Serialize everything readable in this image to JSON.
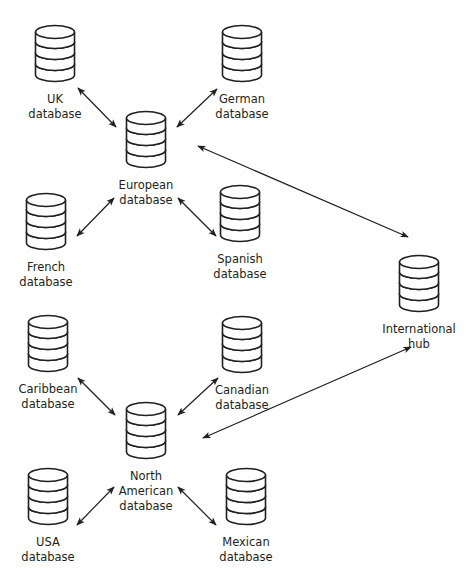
{
  "diagram": {
    "type": "network",
    "colors": {
      "stroke": "#231f20",
      "fill": "#ffffff",
      "background": "#ffffff"
    },
    "nodes": [
      {
        "id": "uk",
        "label": "UK\ndatabase",
        "icon": "database-icon",
        "x": 55,
        "y": 25
      },
      {
        "id": "german",
        "label": "German\ndatabase",
        "icon": "database-icon",
        "x": 242,
        "y": 25
      },
      {
        "id": "european",
        "label": "European\ndatabase",
        "icon": "database-icon",
        "x": 146,
        "y": 111
      },
      {
        "id": "french",
        "label": "French\ndatabase",
        "icon": "database-icon",
        "x": 46,
        "y": 193
      },
      {
        "id": "spanish",
        "label": "Spanish\ndatabase",
        "icon": "database-icon",
        "x": 240,
        "y": 185
      },
      {
        "id": "international",
        "label": "International\nhub",
        "icon": "database-icon",
        "x": 419,
        "y": 255
      },
      {
        "id": "caribbean",
        "label": "Caribbean\ndatabase",
        "icon": "database-icon",
        "x": 48,
        "y": 315
      },
      {
        "id": "canadian",
        "label": "Canadian\ndatabase",
        "icon": "database-icon",
        "x": 242,
        "y": 316
      },
      {
        "id": "north_american",
        "label": "North\nAmerican\ndatabase",
        "icon": "database-icon",
        "x": 146,
        "y": 402
      },
      {
        "id": "usa",
        "label": "USA\ndatabase",
        "icon": "database-icon",
        "x": 48,
        "y": 468
      },
      {
        "id": "mexican",
        "label": "Mexican\ndatabase",
        "icon": "database-icon",
        "x": 246,
        "y": 468
      }
    ],
    "edges": [
      {
        "from": "uk",
        "to": "european",
        "direction": "both",
        "x1": 78,
        "y1": 88,
        "x2": 116,
        "y2": 127
      },
      {
        "from": "german",
        "to": "european",
        "direction": "both",
        "x1": 217,
        "y1": 89,
        "x2": 177,
        "y2": 127
      },
      {
        "from": "french",
        "to": "european",
        "direction": "both",
        "x1": 77,
        "y1": 236,
        "x2": 114,
        "y2": 198
      },
      {
        "from": "spanish",
        "to": "european",
        "direction": "both",
        "x1": 216,
        "y1": 236,
        "x2": 178,
        "y2": 198
      },
      {
        "from": "european",
        "to": "international",
        "direction": "both",
        "x1": 198,
        "y1": 146,
        "x2": 408,
        "y2": 237
      },
      {
        "from": "caribbean",
        "to": "north_american",
        "direction": "both",
        "x1": 78,
        "y1": 378,
        "x2": 115,
        "y2": 415
      },
      {
        "from": "canadian",
        "to": "north_american",
        "direction": "both",
        "x1": 218,
        "y1": 378,
        "x2": 178,
        "y2": 415
      },
      {
        "from": "usa",
        "to": "north_american",
        "direction": "both",
        "x1": 77,
        "y1": 525,
        "x2": 114,
        "y2": 487
      },
      {
        "from": "mexican",
        "to": "north_american",
        "direction": "both",
        "x1": 216,
        "y1": 525,
        "x2": 178,
        "y2": 487
      },
      {
        "from": "north_american",
        "to": "international",
        "direction": "both",
        "x1": 203,
        "y1": 438,
        "x2": 411,
        "y2": 347
      }
    ]
  }
}
